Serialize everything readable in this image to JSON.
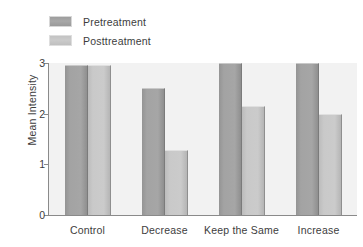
{
  "chart_data": {
    "type": "bar",
    "title": "",
    "xlabel": "",
    "ylabel": "Mean Intensity",
    "categories": [
      "Control",
      "Decrease",
      "Keep the Same",
      "Increase"
    ],
    "series": [
      {
        "name": "Pretreatment",
        "color": "#a3a3a3",
        "values": [
          2.97,
          2.5,
          3.0,
          3.0
        ]
      },
      {
        "name": "Posttreatment",
        "color": "#c9c9c9",
        "values": [
          2.97,
          1.28,
          2.15,
          2.0
        ]
      }
    ],
    "ylim": [
      0,
      3
    ],
    "yticks": [
      "0",
      "1",
      "2",
      "3"
    ],
    "ytick_values": [
      0,
      1,
      2,
      3
    ],
    "grid": false,
    "legend_position": "top-left",
    "plot_background": "#f2f2f2"
  }
}
